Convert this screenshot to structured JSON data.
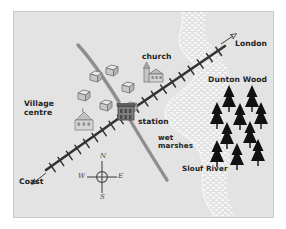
{
  "figure": {
    "type": "schematic-map",
    "background_color": "#ffffff",
    "map_fill_color": "#e3e3e3",
    "border_color": "#c9c9c9"
  },
  "labels": {
    "village_centre_line1": "Village",
    "village_centre_line2": "centre",
    "church": "church",
    "station": "station",
    "coast": "Coast",
    "london": "London",
    "dunton_wood": "Dunton Wood",
    "wet_marshes_line1": "wet",
    "wet_marshes_line2": "marshes",
    "slouf_river": "Slouf River"
  },
  "compass": {
    "north": "N",
    "south": "S",
    "east": "E",
    "west": "W"
  },
  "features": {
    "railway": {
      "name": "railway-line",
      "color": "#333333",
      "description": "Railway running from Coast (south-west) through station to London (north-east), drawn with sleeper tick marks"
    },
    "road": {
      "name": "road-line",
      "color": "#8e8e8e",
      "description": "Curved road passing through the station from north-west to south-east"
    },
    "river": {
      "name": "slouf-river",
      "color": "#f2f2f2",
      "description": "Stippled band of water and wet marshes running north to south on the east side"
    },
    "woodland": {
      "name": "dunton-wood",
      "color": "#111111",
      "tree_count": 10
    },
    "houses": {
      "name": "house-cluster",
      "count": 6,
      "color": "#7a7a7a"
    },
    "arrows": [
      {
        "name": "coast-arrow",
        "direction": "south-west"
      },
      {
        "name": "london-arrow",
        "direction": "north-east"
      }
    ]
  }
}
